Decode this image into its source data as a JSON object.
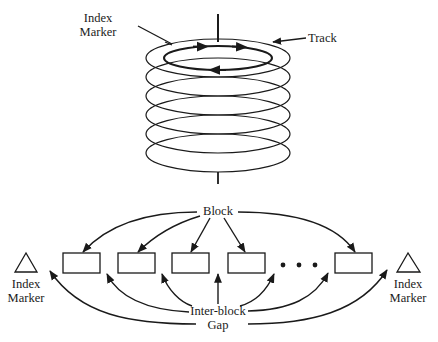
{
  "figure": {
    "type": "disk-track-layout-diagram",
    "top_section": {
      "description": "Stack of disk platters on a spindle; the top platter shows a circular track with direction arrows",
      "platter_count": 6,
      "labels": {
        "index_marker": [
          "Index",
          "Marker"
        ],
        "track": "Track"
      }
    },
    "bottom_section": {
      "description": "Linear track layout: index marker, data blocks separated by inter-block gaps, ellipsis, final block, index marker",
      "labels": {
        "block": "Block",
        "inter_block_gap": [
          "Inter-block",
          "Gap"
        ],
        "index_marker_left": [
          "Index",
          "Marker"
        ],
        "index_marker_right": [
          "Index",
          "Marker"
        ],
        "ellipsis": "• • •"
      },
      "block_count_shown": 5
    }
  },
  "colors": {
    "ink": "#1a1a1a",
    "background": "#ffffff"
  }
}
